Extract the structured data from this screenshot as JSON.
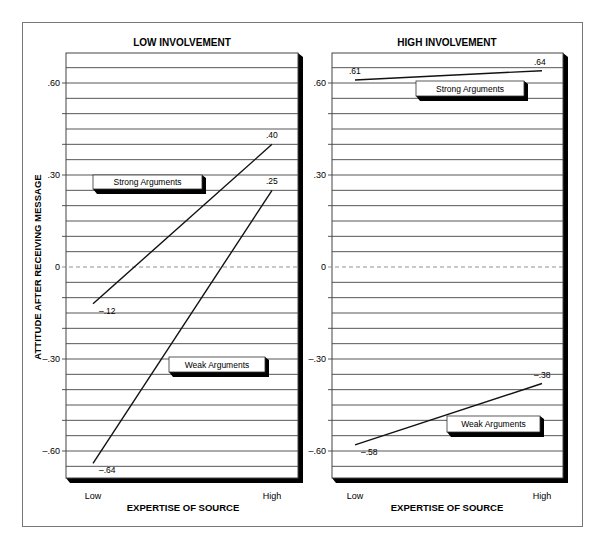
{
  "chart_data": [
    {
      "type": "line",
      "title": "LOW INVOLVEMENT",
      "xlabel": "EXPERTISE OF SOURCE",
      "ylabel": "ATTITUDE AFTER RECEIVING MESSAGE",
      "categories": [
        "Low",
        "High"
      ],
      "series": [
        {
          "name": "Strong Arguments",
          "values": [
            -0.12,
            0.4
          ],
          "labels": [
            "–.12",
            ".40"
          ]
        },
        {
          "name": "Weak Arguments",
          "values": [
            -0.64,
            0.25
          ],
          "labels": [
            "–.64",
            ".25"
          ]
        }
      ],
      "yticks": [
        0.6,
        0.3,
        0,
        -0.3,
        -0.6
      ],
      "ytick_labels": [
        ".60",
        ".30",
        "0",
        "–.30",
        "–.60"
      ],
      "ylim": [
        -0.7,
        0.7
      ],
      "grid": true,
      "gridline_step": 0.05,
      "zero_line": "dashed"
    },
    {
      "type": "line",
      "title": "HIGH INVOLVEMENT",
      "xlabel": "EXPERTISE OF SOURCE",
      "ylabel": "",
      "categories": [
        "Low",
        "High"
      ],
      "series": [
        {
          "name": "Strong Arguments",
          "values": [
            0.61,
            0.64
          ],
          "labels": [
            ".61",
            ".64"
          ]
        },
        {
          "name": "Weak Arguments",
          "values": [
            -0.58,
            -0.38
          ],
          "labels": [
            "–.58",
            "–.38"
          ]
        }
      ],
      "yticks": [
        0.6,
        0.3,
        0,
        -0.3,
        -0.6
      ],
      "ytick_labels": [
        ".60",
        ".30",
        "0",
        "–.30",
        "–.60"
      ],
      "ylim": [
        -0.7,
        0.7
      ],
      "grid": true,
      "gridline_step": 0.05,
      "zero_line": "dashed"
    }
  ],
  "panels": [
    {
      "title": "LOW INVOLVEMENT",
      "xlabel": "EXPERTISE OF SOURCE",
      "ylabel": "ATTITUDE AFTER RECEIVING MESSAGE",
      "x_low": "Low",
      "x_high": "High",
      "legend_strong": "Strong Arguments",
      "legend_weak": "Weak Arguments"
    },
    {
      "title": "HIGH INVOLVEMENT",
      "xlabel": "EXPERTISE OF SOURCE",
      "x_low": "Low",
      "x_high": "High",
      "legend_strong": "Strong Arguments",
      "legend_weak": "Weak Arguments"
    }
  ],
  "colors": {
    "line": "#111111",
    "grid": "#444444",
    "shadow": "#000000",
    "frame": "#777777"
  }
}
